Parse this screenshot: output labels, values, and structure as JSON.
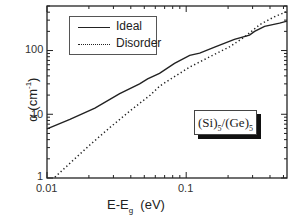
{
  "chart_data": {
    "type": "line",
    "title": "",
    "xlabel": "E-E_g (eV)",
    "ylabel": "α (cm^-1)",
    "xscale": "log",
    "yscale": "log",
    "xlim": [
      0.01,
      0.53
    ],
    "ylim": [
      1,
      500
    ],
    "x_ticks": [
      "0.01",
      "0.1"
    ],
    "y_ticks": [
      "1",
      "10",
      "100"
    ],
    "grid": false,
    "legend_position": "upper left",
    "annotation": "(Si)5/(Ge)5",
    "series": [
      {
        "name": "Ideal",
        "style": "solid",
        "x": [
          0.01,
          0.0146,
          0.0221,
          0.0333,
          0.0463,
          0.0528,
          0.0643,
          0.0824,
          0.106,
          0.125,
          0.16,
          0.222,
          0.285,
          0.31,
          0.366,
          0.469,
          0.53
        ],
        "y": [
          5.9,
          8.3,
          12.5,
          21,
          30,
          36,
          44,
          63,
          84,
          91,
          113,
          150,
          175,
          200,
          240,
          270,
          290
        ]
      },
      {
        "name": "Disorder",
        "style": "dotted",
        "x": [
          0.0114,
          0.0146,
          0.0203,
          0.0283,
          0.0395,
          0.0551,
          0.065,
          0.0824,
          0.106,
          0.148,
          0.206,
          0.264,
          0.338,
          0.432,
          0.53
        ],
        "y": [
          1.03,
          1.7,
          3.3,
          6.2,
          11.3,
          20,
          28,
          39,
          55,
          80,
          115,
          165,
          255,
          340,
          410
        ]
      }
    ]
  },
  "legend": {
    "ideal": "Ideal",
    "disorder": "Disorder"
  },
  "inset": {
    "si": "(Si)",
    "si_sub": "5",
    "sep": "/",
    "ge": "(Ge)",
    "ge_sub": "5"
  },
  "axes": {
    "y_label_main": "α  (cm",
    "y_label_sup": "-1",
    "y_label_end": ")",
    "x_label_main": "E-E",
    "x_label_sub": "g",
    "x_label_unit": "  (eV)",
    "x_tick_001": "0.01",
    "x_tick_01": "0.1",
    "y_tick_1": "1",
    "y_tick_10": "10",
    "y_tick_100": "100"
  }
}
